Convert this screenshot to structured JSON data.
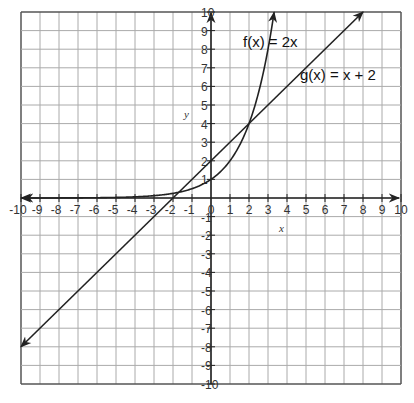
{
  "chart_data": {
    "type": "line",
    "title": "",
    "xlabel": "x",
    "ylabel": "y",
    "xlim": [
      -10,
      10
    ],
    "ylim": [
      -10,
      10
    ],
    "grid": true,
    "x_ticks": [
      -10,
      -9,
      -8,
      -7,
      -6,
      -5,
      -4,
      -3,
      -2,
      -1,
      0,
      1,
      2,
      3,
      4,
      5,
      6,
      7,
      8,
      9,
      10
    ],
    "x_tick_labels": [
      "-10",
      "-9",
      "-8",
      "-7",
      "-6",
      "-5",
      "-4",
      "-3",
      "-2",
      "-1",
      "0",
      "1",
      "2",
      "3",
      "4",
      "5",
      "6",
      "7",
      "8",
      "9",
      "10"
    ],
    "y_ticks": [
      -10,
      -9,
      -8,
      -7,
      -6,
      -5,
      -4,
      -3,
      -2,
      -1,
      1,
      2,
      3,
      4,
      5,
      6,
      7,
      8,
      9,
      10
    ],
    "y_tick_labels": [
      "-10",
      "-9",
      "-8",
      "-7",
      "-6",
      "-5",
      "-4",
      "-3",
      "-2",
      "-1",
      "1",
      "2",
      "3",
      "4",
      "5",
      "6",
      "7",
      "8",
      "9",
      "10"
    ],
    "series": [
      {
        "name": "f(x) = 2x",
        "label": "f(x) = 2x",
        "formula": "2^x",
        "x_range": [
          -10,
          3.32
        ],
        "color": "#222222"
      },
      {
        "name": "g(x) = x + 2",
        "label": "g(x) = x + 2",
        "formula": "x+2",
        "x_range": [
          -10,
          8
        ],
        "color": "#222222"
      }
    ],
    "intersections": [
      [
        -1.69,
        0.31
      ],
      [
        2,
        4
      ]
    ]
  }
}
